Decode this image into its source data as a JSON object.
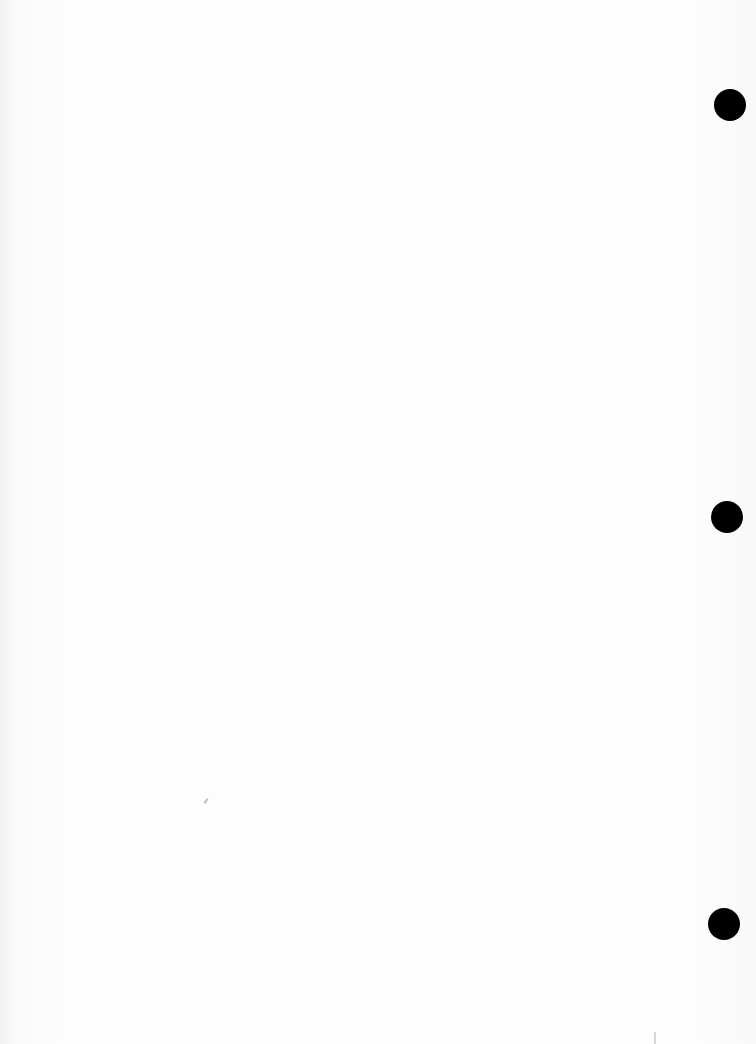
{
  "document": {
    "type": "blank scanned page",
    "bleed_through_text": [
      "",
      "",
      "",
      ""
    ],
    "punch_holes": [
      {
        "x": 714,
        "y": 89,
        "size": 32
      },
      {
        "x": 711,
        "y": 501,
        "size": 32
      },
      {
        "x": 708,
        "y": 908,
        "size": 32
      }
    ],
    "colors": {
      "paper": "#fbfbfb",
      "hole": "#000000"
    }
  }
}
